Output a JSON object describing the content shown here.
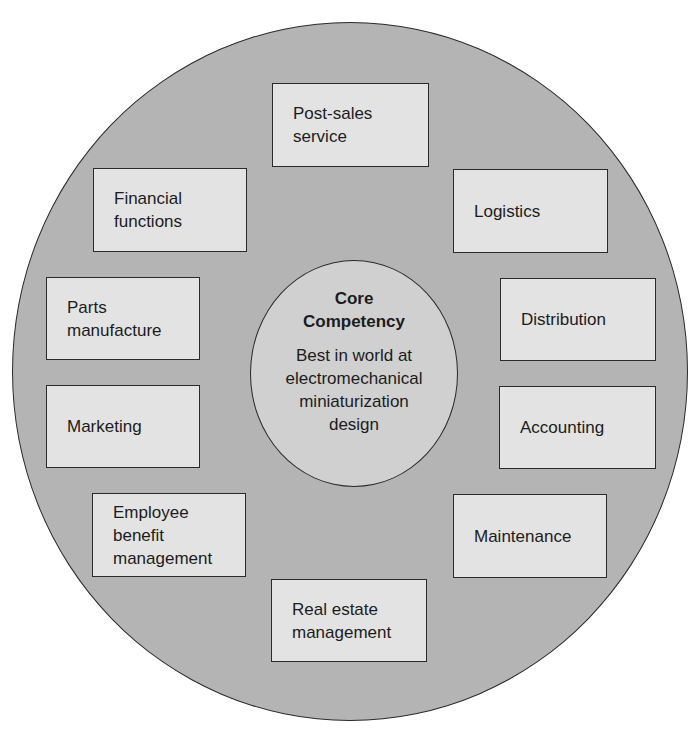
{
  "diagram": {
    "title_fragment": "",
    "core": {
      "title": "Core\nCompetency",
      "title_line1": "Core",
      "title_line2": "Competency",
      "description_lines": [
        "Best in world at",
        "electromechanical",
        "miniaturization",
        "design"
      ]
    },
    "activities": [
      {
        "id": "post-sales-service",
        "label": "Post-sales\nservice"
      },
      {
        "id": "financial-functions",
        "label": "Financial\nfunctions"
      },
      {
        "id": "logistics",
        "label": "Logistics"
      },
      {
        "id": "parts-manufacture",
        "label": "Parts\nmanufacture"
      },
      {
        "id": "distribution",
        "label": "Distribution"
      },
      {
        "id": "marketing",
        "label": "Marketing"
      },
      {
        "id": "accounting",
        "label": "Accounting"
      },
      {
        "id": "employee-benefit-management",
        "label": "Employee\nbenefit\nmanagement"
      },
      {
        "id": "maintenance",
        "label": "Maintenance"
      },
      {
        "id": "real-estate-management",
        "label": "Real estate\nmanagement"
      }
    ],
    "colors": {
      "outer_circle": "#b4b4b4",
      "inner_circle": "#d0d0d0",
      "box_fill": "#e3e3e3",
      "stroke": "#2a2a2a",
      "text": "#1c1c1c"
    }
  }
}
